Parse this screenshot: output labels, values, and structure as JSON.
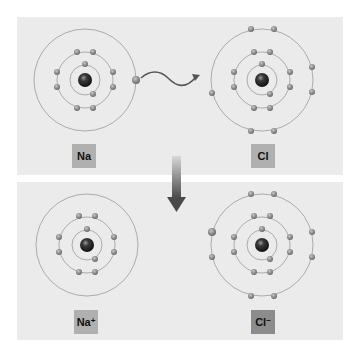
{
  "colors": {
    "panel_bg": "#ebebeb",
    "orbit": "#9a9a9a",
    "electron": "#8f8f8f",
    "nucleus": "#2a2a2a",
    "arrow": "#5a5a5a",
    "label_light": "#b0b0b0",
    "label_dark": "#8c8c8c"
  },
  "top_panel": {
    "sodium": {
      "label": "Na",
      "superscript": "",
      "center": [
        85,
        80
      ],
      "shells": 3,
      "electrons": [
        2,
        8,
        1
      ]
    },
    "chlorine": {
      "label": "Cl",
      "superscript": "",
      "center": [
        262,
        80
      ],
      "shells": 3,
      "electrons": [
        2,
        8,
        7
      ]
    },
    "transfer_arrow": "wavy-arrow"
  },
  "transition_arrow": "down-arrow",
  "bottom_panel": {
    "sodium_ion": {
      "label": "Na",
      "superscript": "+",
      "center": [
        87,
        245
      ],
      "shells": 3,
      "electrons": [
        2,
        8,
        0
      ]
    },
    "chloride_ion": {
      "label": "Cl",
      "superscript": "−",
      "center": [
        262,
        245
      ],
      "shells": 3,
      "electrons": [
        2,
        8,
        8
      ]
    }
  }
}
